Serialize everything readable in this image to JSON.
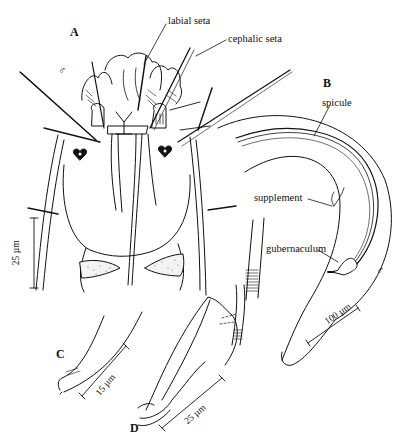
{
  "figure": {
    "panels": [
      {
        "id": "A",
        "label": "A",
        "sex_symbol": "♂"
      },
      {
        "id": "B",
        "label": "B",
        "sex_symbol": "♂"
      },
      {
        "id": "C",
        "label": "C"
      },
      {
        "id": "D",
        "label": "D"
      }
    ],
    "annotations": {
      "labial_seta": "labial seta",
      "cephalic_seta": "cephalic seta",
      "spicule": "spicule",
      "supplement": "supplement",
      "gubernaculum": "gubernaculum"
    },
    "scale_bars": {
      "a": "25 µm",
      "b": "100 µm",
      "c": "15 µm",
      "d": "25 µm"
    },
    "colors": {
      "ink": "#111111",
      "background": "#ffffff"
    }
  }
}
